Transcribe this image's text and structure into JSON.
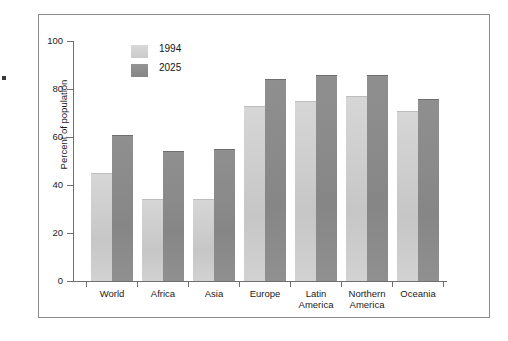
{
  "figure": {
    "frame_color": "#8d8d8d",
    "background": "#ffffff"
  },
  "legend": {
    "position": "top-left-inside",
    "entries": [
      {
        "label": "1994",
        "swatch_name": "legend-swatch-1994",
        "color": "#cfcfcf"
      },
      {
        "label": "2025",
        "swatch_name": "legend-swatch-2025",
        "color": "#8a8a8a"
      }
    ]
  },
  "axes": {
    "y_title": "Percent of population",
    "y_ticks": [
      "0",
      "20",
      "40",
      "60",
      "80",
      "100"
    ],
    "y_tick_values": [
      0,
      20,
      40,
      60,
      80,
      100
    ],
    "x_ticks": []
  },
  "chart_data": {
    "type": "bar",
    "title": "",
    "subtitle": "",
    "xlabel": "",
    "ylabel": "Percent of population",
    "ylim": [
      0,
      100
    ],
    "grid": false,
    "legend_position": "top-left-inside",
    "categories": [
      "World",
      "Africa",
      "Asia",
      "Europe",
      "Latin America",
      "Northern America",
      "Oceania"
    ],
    "category_lines": [
      [
        "World"
      ],
      [
        "Africa"
      ],
      [
        "Asia"
      ],
      [
        "Europe"
      ],
      [
        "Latin",
        "America"
      ],
      [
        "Northern",
        "America"
      ],
      [
        "Oceania"
      ]
    ],
    "series": [
      {
        "name": "1994",
        "color": "#cfcfcf",
        "values": [
          45,
          34,
          34,
          73,
          75,
          77,
          71
        ]
      },
      {
        "name": "2025",
        "color": "#8a8a8a",
        "values": [
          61,
          54,
          55,
          84,
          86,
          86,
          76
        ]
      }
    ]
  }
}
